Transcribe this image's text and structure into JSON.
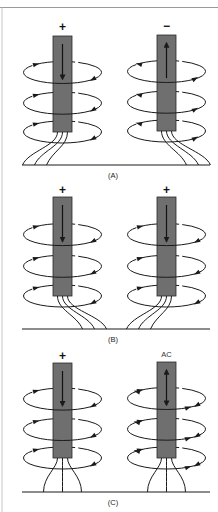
{
  "figure": {
    "colors": {
      "rod_fill": "#6f6f6f",
      "rod_stroke": "#2a2a2a",
      "line": "#1a1a1a",
      "border": "#9a9a9a",
      "background": "#ffffff"
    },
    "panels": [
      {
        "id": "A",
        "label": "(A)",
        "ground_y": 165,
        "label_y": 178,
        "electrodes": [
          {
            "polarity": "+",
            "x": 53,
            "top": 36,
            "bottom": 132,
            "arrow": "down",
            "wire_spread": "left",
            "field_direction": "counterclockwise"
          },
          {
            "polarity": "−",
            "x": 157,
            "top": 35,
            "bottom": 131,
            "arrow": "up",
            "wire_spread": "right",
            "field_direction": "clockwise"
          }
        ]
      },
      {
        "id": "B",
        "label": "(B)",
        "ground_y": 329,
        "label_y": 342,
        "electrodes": [
          {
            "polarity": "+",
            "x": 53,
            "top": 197,
            "bottom": 296,
            "arrow": "down",
            "wire_spread": "right",
            "field_direction": "counterclockwise"
          },
          {
            "polarity": "+",
            "x": 157,
            "top": 197,
            "bottom": 296,
            "arrow": "down",
            "wire_spread": "left",
            "field_direction": "counterclockwise"
          }
        ]
      },
      {
        "id": "C",
        "label": "(C)",
        "ground_y": 492,
        "label_y": 505,
        "electrodes": [
          {
            "polarity": "+",
            "x": 53,
            "top": 363,
            "bottom": 458,
            "arrow": "down",
            "wire_spread": "symmetric",
            "field_direction": "counterclockwise"
          },
          {
            "polarity": "AC",
            "x": 157,
            "top": 362,
            "bottom": 458,
            "arrow": "both",
            "wire_spread": "symmetric",
            "field_direction": "alternating"
          }
        ]
      }
    ]
  }
}
